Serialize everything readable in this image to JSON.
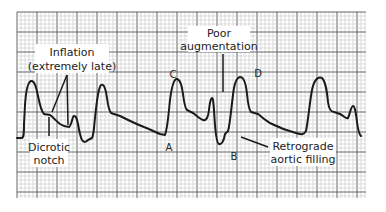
{
  "figure": {
    "type": "arterial pressure waveform on grid paper",
    "grid": {
      "x0": 17,
      "y0": 12,
      "x1": 366,
      "y1": 198,
      "minor_spacing": 4,
      "major_every": 5,
      "minor_color": "#b8b8b8",
      "major_color": "#555555"
    },
    "trace_color": "#1a1a1a"
  },
  "annotations": {
    "inflation": {
      "line1": "Inflation",
      "line2": "(extremely late)"
    },
    "poor_augmentation": {
      "line1": "Poor",
      "line2": "augmentation"
    },
    "dicrotic_notch": {
      "line1": "Dicrotic",
      "line2": "notch"
    },
    "retrograde": {
      "line1": "Retrograde",
      "line2": "aortic filling"
    }
  },
  "points": {
    "A": "A",
    "B": "B",
    "C": "C",
    "D": "D"
  }
}
